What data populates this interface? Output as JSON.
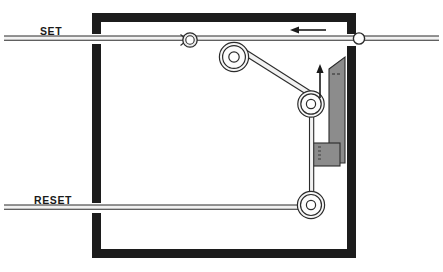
{
  "diagram": {
    "background_color": "#ffffff",
    "frame": {
      "name": "housing-frame",
      "color": "#1c1c1c",
      "stroke_width": 9,
      "left": 92,
      "top": 13,
      "right": 352,
      "bottom": 258,
      "gap_set_y": 38,
      "gap_reset_y": 207,
      "gap_height": 12
    },
    "labels": {
      "set": "SET",
      "reset": "RESET"
    },
    "cables": {
      "color": "#2b2b2b",
      "fill": "#f0f0f0",
      "set_line_y": 38,
      "reset_line_y": 207,
      "set_line_x_start": 4,
      "set_line_x_end": 439,
      "reset_line_x_start": 4,
      "reset_line_x_end": 310
    },
    "pulleys": [
      {
        "name": "pulley-upper",
        "cx": 234,
        "cy": 57,
        "r_outer": 14.5,
        "r_mid": 11.5,
        "r_hub": 5
      },
      {
        "name": "pulley-middle",
        "cx": 311,
        "cy": 104,
        "r_outer": 13,
        "r_mid": 10,
        "r_hub": 4.5
      },
      {
        "name": "pulley-lower",
        "cx": 311,
        "cy": 205,
        "r_outer": 13.5,
        "r_mid": 10.5,
        "r_hub": 4.5
      }
    ],
    "clamp_ring": {
      "name": "cable-clamp-ring",
      "cx": 190,
      "cy": 40,
      "r": 7
    },
    "eyelet": {
      "name": "cable-eyelet",
      "cx": 359,
      "cy": 40,
      "r": 5.5,
      "fill": "#ffffff"
    },
    "blade": {
      "name": "actuator-blade",
      "fill": "#8c8c8c",
      "stroke": "#2b2b2b",
      "top_y": 57,
      "bottom_y": 163,
      "left_x": 327,
      "right_x": 348,
      "bevel_drop": 12
    },
    "blade_block": {
      "name": "blade-base-block",
      "fill": "#8c8c8c",
      "stroke": "#2b2b2b",
      "x": 312,
      "y": 143,
      "width": 28,
      "height": 22
    },
    "wall_bar": {
      "name": "right-wall-bar",
      "fill": "#1c1c1c",
      "x": 352,
      "y": 13,
      "width": 9,
      "height": 245
    },
    "arrows": [
      {
        "name": "arrow-set-direction",
        "direction": "left",
        "x1": 325,
        "y1": 30,
        "x2": 291,
        "y2": 30,
        "color": "#1a1a1a"
      },
      {
        "name": "arrow-blade-direction",
        "direction": "up",
        "x1": 320,
        "y1": 97,
        "x2": 320,
        "y2": 65,
        "color": "#1a1a1a"
      }
    ]
  }
}
